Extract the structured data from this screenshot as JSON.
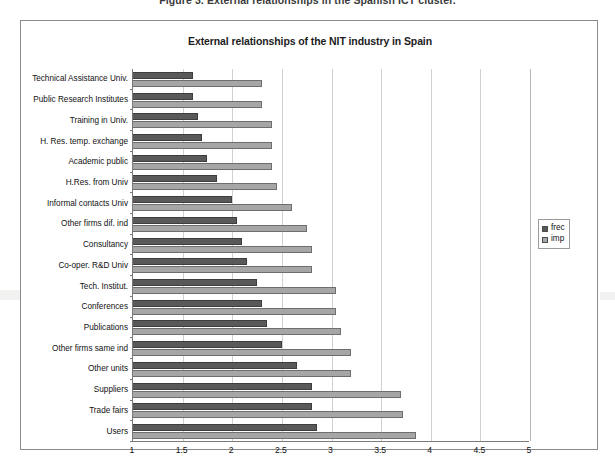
{
  "figure": {
    "caption": "Figure 3. External relationships in the Spanish ICT cluster."
  },
  "chart_data": {
    "type": "bar",
    "orientation": "horizontal",
    "title": "External relationships of the NIT industry in Spain",
    "xlabel": "",
    "ylabel": "",
    "xlim": [
      1,
      5
    ],
    "xticks": [
      "1",
      "1.5",
      "2",
      "2.5",
      "3",
      "3.5",
      "4",
      "4.5",
      "5"
    ],
    "grid": true,
    "legend_position": "right",
    "categories": [
      "Technical Assistance Univ.",
      "Public Research Institutes",
      "Training in Univ.",
      "H. Res. temp. exchange",
      "Academic public",
      "H.Res. from Univ",
      "Informal contacts Univ",
      "Other firms dif. ind",
      "Consultancy",
      "Co-oper. R&D Univ",
      "Tech. Institut.",
      "Conferences",
      "Publications",
      "Other firms same ind",
      "Other units",
      "Suppliers",
      "Trade fairs",
      "Users"
    ],
    "series": [
      {
        "name": "frec",
        "color": "#595959",
        "values": [
          1.6,
          1.6,
          1.65,
          1.7,
          1.75,
          1.85,
          2.0,
          2.05,
          2.1,
          2.15,
          2.25,
          2.3,
          2.35,
          2.5,
          2.65,
          2.8,
          2.8,
          2.85
        ]
      },
      {
        "name": "imp",
        "color": "#a6a6a6",
        "values": [
          2.3,
          2.3,
          2.4,
          2.4,
          2.4,
          2.45,
          2.6,
          2.75,
          2.8,
          2.8,
          3.05,
          3.05,
          3.1,
          3.2,
          3.2,
          3.7,
          3.72,
          3.85
        ]
      }
    ]
  },
  "legend": {
    "items": [
      {
        "label": "frec"
      },
      {
        "label": "imp"
      }
    ]
  }
}
